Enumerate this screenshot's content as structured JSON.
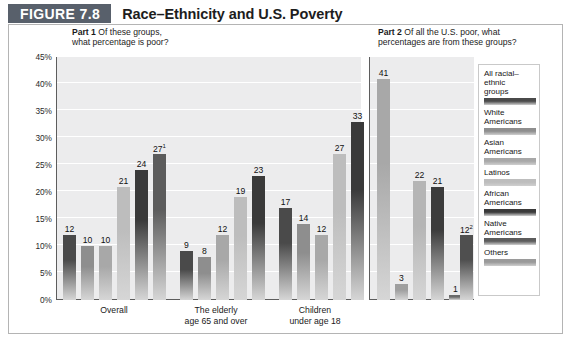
{
  "figure": {
    "badge": "FIGURE 7.8",
    "title": "Race–Ethnicity and U.S. Poverty"
  },
  "part1": {
    "heading_bold": "Part 1",
    "heading_line1": "Of these groups,",
    "heading_line2": "what percentage is poor?"
  },
  "part2": {
    "heading_bold": "Part 2",
    "heading_line1": "Of all the U.S. poor, what",
    "heading_line2": "percentages are from these groups?"
  },
  "legend": {
    "items": [
      {
        "label": "All racial–\nethnic\ngroups",
        "color": "#4a4a4a"
      },
      {
        "label": "White\nAmericans",
        "color": "#8e8e8e"
      },
      {
        "label": "Asian\nAmericans",
        "color": "#a8a8a8"
      },
      {
        "label": "Latinos",
        "color": "#bdbdbd"
      },
      {
        "label": "African\nAmericans",
        "color": "#3a3a3a"
      },
      {
        "label": "Native\nAmericans",
        "color": "#5c5c5c"
      },
      {
        "label": "Others",
        "color": "#9a9a9a"
      }
    ]
  },
  "chart_data": {
    "type": "bar",
    "title": "Race–Ethnicity and U.S. Poverty",
    "ylabel": "Percentage",
    "xlabel": "",
    "ylim": [
      0,
      45
    ],
    "ytick_labels": [
      "0%",
      "5%",
      "10%",
      "15%",
      "20%",
      "25%",
      "30%",
      "35%",
      "40%",
      "45%"
    ],
    "ytick_values": [
      0,
      5,
      10,
      15,
      20,
      25,
      30,
      35,
      40,
      45
    ],
    "grid": true,
    "legend_position": "right",
    "panels": [
      {
        "name": "Part 1",
        "question": "Of these groups, what percentage is poor?",
        "categories": [
          "Overall",
          "The elderly\nage 65 and over",
          "Children\nunder age 18"
        ],
        "series": [
          {
            "name": "All racial–ethnic groups",
            "color": "#4a4a4a",
            "values": [
              12,
              9,
              17
            ],
            "labels": [
              "12",
              "9",
              "17"
            ]
          },
          {
            "name": "White Americans",
            "color": "#8e8e8e",
            "values": [
              10,
              8,
              14
            ],
            "labels": [
              "10",
              "8",
              "14"
            ]
          },
          {
            "name": "Asian Americans",
            "color": "#a8a8a8",
            "values": [
              10,
              12,
              12
            ],
            "labels": [
              "10",
              "12",
              "12"
            ]
          },
          {
            "name": "Latinos",
            "color": "#bdbdbd",
            "values": [
              21,
              19,
              27
            ],
            "labels": [
              "21",
              "19",
              "27"
            ]
          },
          {
            "name": "African Americans",
            "color": "#3a3a3a",
            "values": [
              24,
              23,
              33
            ],
            "labels": [
              "24",
              "23",
              "33"
            ]
          },
          {
            "name": "Native Americans",
            "color": "#5c5c5c",
            "values": [
              27,
              null,
              null
            ],
            "labels": [
              "27¹",
              null,
              null
            ]
          }
        ]
      },
      {
        "name": "Part 2",
        "question": "Of all the U.S. poor, what percentages are from these groups?",
        "categories": [
          ""
        ],
        "series": [
          {
            "name": "White Americans",
            "color": "#a8a8a8",
            "values": [
              41
            ],
            "labels": [
              "41"
            ]
          },
          {
            "name": "Asian Americans",
            "color": "#9f9f9f",
            "values": [
              3
            ],
            "labels": [
              "3"
            ]
          },
          {
            "name": "Latinos",
            "color": "#b5b5b5",
            "values": [
              22
            ],
            "labels": [
              "22"
            ]
          },
          {
            "name": "African Americans",
            "color": "#3c3c3c",
            "values": [
              21
            ],
            "labels": [
              "21"
            ]
          },
          {
            "name": "Native Americans",
            "color": "#6a6a6a",
            "values": [
              1
            ],
            "labels": [
              "1"
            ]
          },
          {
            "name": "Others",
            "color": "#4f4f4f",
            "values": [
              12
            ],
            "labels": [
              "12²"
            ]
          }
        ]
      }
    ]
  },
  "bars_left": [
    {
      "label": "12",
      "sup": "",
      "value": 12,
      "x": 63,
      "w": 13,
      "color": "#4a4a4a"
    },
    {
      "label": "10",
      "sup": "",
      "value": 10,
      "x": 81,
      "w": 13,
      "color": "#8e8e8e"
    },
    {
      "label": "10",
      "sup": "",
      "value": 10,
      "x": 99,
      "w": 13,
      "color": "#a8a8a8"
    },
    {
      "label": "21",
      "sup": "",
      "value": 21,
      "x": 117,
      "w": 13,
      "color": "#bdbdbd"
    },
    {
      "label": "24",
      "sup": "",
      "value": 24,
      "x": 135,
      "w": 13,
      "color": "#3a3a3a"
    },
    {
      "label": "27",
      "sup": "1",
      "value": 27,
      "x": 153,
      "w": 13,
      "color": "#5c5c5c"
    },
    {
      "label": "9",
      "sup": "",
      "value": 9,
      "x": 180,
      "w": 13,
      "color": "#4a4a4a"
    },
    {
      "label": "8",
      "sup": "",
      "value": 8,
      "x": 198,
      "w": 13,
      "color": "#8e8e8e"
    },
    {
      "label": "12",
      "sup": "",
      "value": 12,
      "x": 216,
      "w": 13,
      "color": "#a8a8a8"
    },
    {
      "label": "19",
      "sup": "",
      "value": 19,
      "x": 234,
      "w": 13,
      "color": "#bdbdbd"
    },
    {
      "label": "23",
      "sup": "",
      "value": 23,
      "x": 252,
      "w": 13,
      "color": "#3a3a3a"
    },
    {
      "label": "17",
      "sup": "",
      "value": 17,
      "x": 279,
      "w": 13,
      "color": "#4a4a4a"
    },
    {
      "label": "14",
      "sup": "",
      "value": 14,
      "x": 297,
      "w": 13,
      "color": "#8e8e8e"
    },
    {
      "label": "12",
      "sup": "",
      "value": 12,
      "x": 315,
      "w": 13,
      "color": "#a8a8a8"
    },
    {
      "label": "27",
      "sup": "",
      "value": 27,
      "x": 333,
      "w": 13,
      "color": "#bdbdbd"
    },
    {
      "label": "33",
      "sup": "",
      "value": 33,
      "x": 351,
      "w": 13,
      "color": "#3a3a3a"
    }
  ],
  "bars_right": [
    {
      "label": "41",
      "sup": "",
      "value": 41,
      "x": 377,
      "w": 13,
      "color": "#a8a8a8"
    },
    {
      "label": "3",
      "sup": "",
      "value": 3,
      "x": 395,
      "w": 13,
      "color": "#9f9f9f"
    },
    {
      "label": "22",
      "sup": "",
      "value": 22,
      "x": 413,
      "w": 13,
      "color": "#b5b5b5"
    },
    {
      "label": "21",
      "sup": "",
      "value": 21,
      "x": 431,
      "w": 13,
      "color": "#3c3c3c"
    },
    {
      "label": "1",
      "sup": "",
      "value": 1,
      "x": 449,
      "w": 13,
      "color": "#6a6a6a"
    },
    {
      "label": "12",
      "sup": "2",
      "value": 12,
      "x": 460,
      "w": 13,
      "color": "#4f4f4f"
    }
  ],
  "xgroups": [
    {
      "line1": "Overall",
      "line2": "",
      "x": 114
    },
    {
      "line1": "The elderly",
      "line2": "age 65 and over",
      "x": 216
    },
    {
      "line1": "Children",
      "line2": "under age 18",
      "x": 315
    }
  ]
}
